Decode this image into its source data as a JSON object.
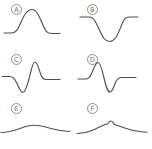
{
  "figure": {
    "background_color": "#ffffff",
    "stroke_color": "#4f4f4f",
    "label_color": "#6f6f6f",
    "label_circle_color": "#8d8d8d",
    "layout": {
      "columns": 2,
      "rows": 3,
      "panel_width": 76,
      "panel_height": 49.67
    }
  },
  "panels": [
    {
      "id": "A",
      "label": "A",
      "name": "panel-a-gaussian-peak",
      "description": "single smooth positive peak on flat baseline",
      "path": "M 4 33 L 11 33 C 14 33 15.5 32 17 30 C 20 26 22 18 26 13 C 28.5 10 30 9.5 32 9.5 C 34 9.5 35.5 10.5 37.5 13.5 C 41 19 43 27 46 31 C 47.5 33 49 33.5 52 33.5 L 60 33.5"
    },
    {
      "id": "B",
      "label": "B",
      "name": "panel-b-inverted-trough",
      "description": "single smooth negative trough on flat baseline",
      "path": "M 4 17 L 13 17 C 16 17 17.5 18.5 19 21 C 22 26 24.5 34 28 38.5 C 30 41 31.5 41.5 33.5 41.5 C 36 41.5 37.5 40.5 39.5 38 C 43 33.5 45 25 48 20 C 49.5 17.5 51 17 54 17 L 62 17"
    },
    {
      "id": "C",
      "label": "C",
      "name": "panel-c-trough-then-peak",
      "description": "flat baseline, dips to a trough, then rises to a tall peak, returns flat",
      "path": "M 2 26.5 L 10 26.5 C 13 26.5 14.5 28.5 16.5 32.5 C 19 37.5 20.5 42.5 23 42.5 C 25 42.5 26.5 38 29 29 C 31 21.5 32.5 12 35 12 C 37.5 12 39 20 41 25 C 42.5 28.5 44 29.5 46 29.5 L 60 29.5"
    },
    {
      "id": "D",
      "label": "D",
      "name": "panel-d-peak-then-trough",
      "description": "flat baseline, rises to a peak, drops to a deep trough, returns flat",
      "path": "M 2 29 L 10 29 C 13 29 14 27 16 22.5 C 18 18 19.5 12.5 22 12.5 C 24.5 12.5 26 20 28 28 C 30 36.5 31.5 42 34 42 C 36.5 42 38 35.5 40 31.5 C 41.5 28.5 43 27.5 45 27.5 L 60 27.5"
    },
    {
      "id": "E",
      "label": "E",
      "name": "panel-e-broad-shallow-bump",
      "description": "very broad shallow wide bump, nearly flat",
      "path": "M 1 33.5 C 8 33.5 13 32 20 29.5 C 26 27.3 30 26.3 34 26.3 C 39 26.3 44 27.5 51 29.5 C 58 31.5 63 32.3 70 32.5"
    },
    {
      "id": "F",
      "label": "F",
      "name": "panel-f-broad-bump-with-spike",
      "description": "broad bump with a small narrow spike near its apex",
      "path": "M 1 34.5 C 7 34.5 11 33.5 16 31.5 C 21 29.5 24 27.5 28 26 C 29.5 25.4 30.3 25.2 31 25.2 C 31.8 25.2 32.3 24.2 33 23.2 C 33.6 22.4 34.2 22 35 22 C 35.8 22 36.4 22.5 37 23.4 C 37.7 24.4 38.2 25.4 39 25.8 C 40 26.3 41 26.4 43 27 C 48 28.6 53 30.5 59 31.8 C 64 32.9 67 33.2 71 33.3"
    }
  ]
}
